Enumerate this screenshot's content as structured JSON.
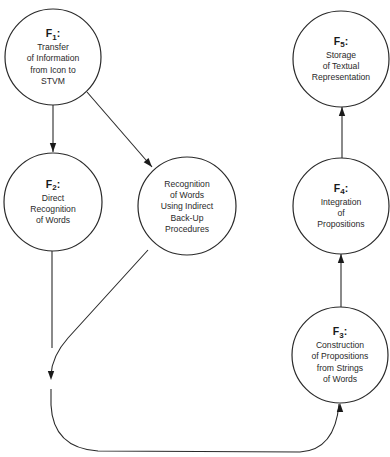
{
  "nodes": [
    {
      "id": "F1",
      "label": "F",
      "subscript": "1",
      "suffix": ":",
      "lines": [
        "Transfer",
        "of Information",
        "from Icon to",
        "STVM"
      ]
    },
    {
      "id": "F2",
      "label": "F",
      "subscript": "2",
      "suffix": ":",
      "lines": [
        "Direct",
        "Recognition",
        "of Words"
      ]
    },
    {
      "id": "R",
      "label": "",
      "subscript": "",
      "suffix": "",
      "lines": [
        "Recognition",
        "of Words",
        "Using Indirect",
        "Back-Up",
        "Procedures"
      ]
    },
    {
      "id": "F3",
      "label": "F",
      "subscript": "3",
      "suffix": ":",
      "lines": [
        "Construction",
        "of Propositions",
        "from Strings",
        "of Words"
      ]
    },
    {
      "id": "F4",
      "label": "F",
      "subscript": "4",
      "suffix": ":",
      "lines": [
        "Integration",
        "of",
        "Propositions"
      ]
    },
    {
      "id": "F5",
      "label": "F",
      "subscript": "5",
      "suffix": ":",
      "lines": [
        "Storage",
        "of Textual",
        "Representation"
      ]
    }
  ],
  "edges": [
    {
      "from": "F1",
      "to": "F2"
    },
    {
      "from": "F1",
      "to": "R"
    },
    {
      "from": "F2",
      "to": "F3",
      "via": "merge"
    },
    {
      "from": "R",
      "to": "F3",
      "via": "merge"
    },
    {
      "from": "F3",
      "to": "F4"
    },
    {
      "from": "F4",
      "to": "F5"
    }
  ]
}
